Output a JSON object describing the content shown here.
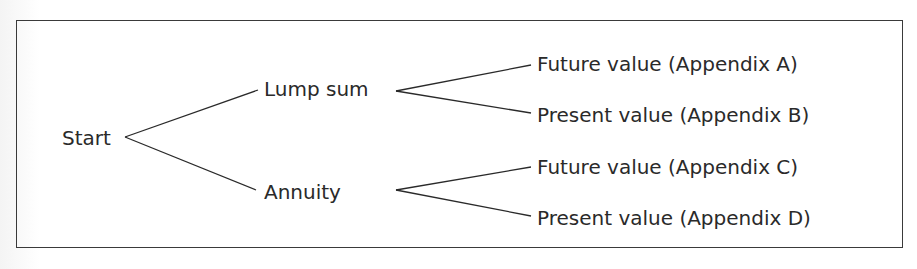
{
  "diagram": {
    "type": "decision-tree",
    "root": {
      "label": "Start"
    },
    "level1": [
      {
        "label": "Lump sum"
      },
      {
        "label": "Annuity"
      }
    ],
    "level2": [
      {
        "label": "Future value (Appendix A)",
        "parent": "Lump sum"
      },
      {
        "label": "Present value (Appendix B)",
        "parent": "Lump sum"
      },
      {
        "label": "Future value (Appendix C)",
        "parent": "Annuity"
      },
      {
        "label": "Present value (Appendix D)",
        "parent": "Annuity"
      }
    ],
    "colors": {
      "line": "#2a2a2a",
      "text": "#2a2a2a",
      "border": "#3a3a3a",
      "background": "#ffffff"
    }
  }
}
